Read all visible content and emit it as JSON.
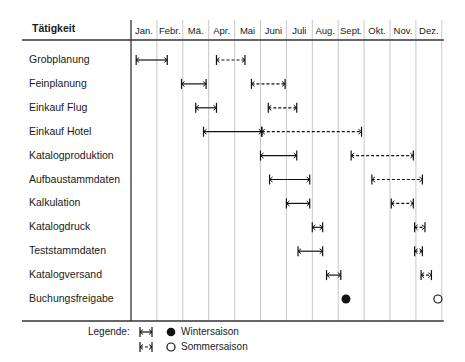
{
  "chart_data": {
    "type": "gantt",
    "title": "",
    "column_header": "Tätigkeit",
    "months": [
      "Jan.",
      "Febr.",
      "Mä.",
      "Apr.",
      "Mai",
      "Juni",
      "Juli",
      "Aug.",
      "Sept.",
      "Okt.",
      "Nov.",
      "Dez."
    ],
    "legend": {
      "label": "Legende:",
      "items": [
        {
          "symbol": "solid-bar",
          "marker": "filled-circle",
          "name": "Wintersaison"
        },
        {
          "symbol": "dashed-bar",
          "marker": "open-circle",
          "name": "Sommersaison"
        }
      ]
    },
    "activities": [
      {
        "name": "Grobplanung",
        "winter": [
          0.2,
          1.4
        ],
        "summer": [
          3.3,
          4.4
        ]
      },
      {
        "name": "Feinplanung",
        "winter": [
          1.95,
          2.9
        ],
        "summer": [
          4.65,
          5.95
        ]
      },
      {
        "name": "Einkauf Flug",
        "winter": [
          2.5,
          3.3
        ],
        "summer": [
          5.3,
          6.4
        ]
      },
      {
        "name": "Einkauf Hotel",
        "winter": [
          2.8,
          5.05
        ],
        "summer": [
          5.05,
          8.9
        ]
      },
      {
        "name": "Katalogproduktion",
        "winter": [
          5.0,
          6.4
        ],
        "summer": [
          8.5,
          10.9
        ]
      },
      {
        "name": "Aufbaustammdaten",
        "winter": [
          5.35,
          6.9
        ],
        "summer": [
          9.3,
          11.25
        ]
      },
      {
        "name": "Kalkulation",
        "winter": [
          6.0,
          6.9
        ],
        "summer": [
          10.05,
          10.9
        ]
      },
      {
        "name": "Katalogdruck",
        "winter": [
          7.0,
          7.4
        ],
        "summer": [
          10.95,
          11.35
        ]
      },
      {
        "name": "Teststammdaten",
        "winter": [
          6.45,
          7.4
        ],
        "summer": [
          10.95,
          11.25
        ]
      },
      {
        "name": "Katalogversand",
        "winter": [
          7.55,
          8.1
        ],
        "summer": [
          11.2,
          11.6
        ]
      },
      {
        "name": "Buchungsfreigabe",
        "winter_milestone": 8.3,
        "summer_milestone": 11.85
      }
    ]
  }
}
